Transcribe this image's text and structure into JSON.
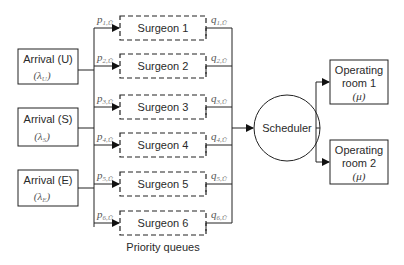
{
  "diagram": {
    "type": "queueing-flow",
    "arrivals": [
      {
        "label": "Arrival (U)",
        "class": "U",
        "rate_symbol": "λ",
        "rate_sub": "U"
      },
      {
        "label": "Arrival (S)",
        "class": "S",
        "rate_symbol": "λ",
        "rate_sub": "S"
      },
      {
        "label": "Arrival (E)",
        "class": "E",
        "rate_symbol": "λ",
        "rate_sub": "E"
      }
    ],
    "queues": [
      {
        "label": "Surgeon 1",
        "p": "p",
        "p_sub": "1,Ū",
        "q": "q",
        "q_sub": "1,Ū"
      },
      {
        "label": "Surgeon 2",
        "p": "p",
        "p_sub": "2,Ū",
        "q": "q",
        "q_sub": "2,Ū"
      },
      {
        "label": "Surgeon 3",
        "p": "p",
        "p_sub": "3,Ū",
        "q": "q",
        "q_sub": "3,Ū"
      },
      {
        "label": "Surgeon 4",
        "p": "p",
        "p_sub": "4,Ū",
        "q": "q",
        "q_sub": "4,Ū"
      },
      {
        "label": "Surgeon 5",
        "p": "p",
        "p_sub": "5,Ū",
        "q": "q",
        "q_sub": "5,Ū"
      },
      {
        "label": "Surgeon 6",
        "p": "p",
        "p_sub": "6,Ū",
        "q": "q",
        "q_sub": "6,Ū"
      }
    ],
    "queues_caption": "Priority queues",
    "scheduler": {
      "label": "Scheduler"
    },
    "operating_rooms": [
      {
        "line1": "Operating",
        "line2": "room 1",
        "rate": "(μ)"
      },
      {
        "line1": "Operating",
        "line2": "room 2",
        "rate": "(μ)"
      }
    ]
  }
}
